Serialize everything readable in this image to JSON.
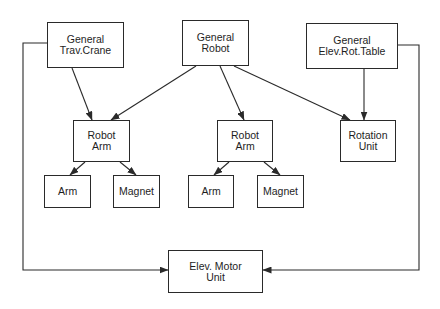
{
  "nodes": {
    "trav_crane": {
      "line1": "General",
      "line2": "Trav.Crane"
    },
    "robot": {
      "line1": "General",
      "line2": "Robot"
    },
    "elev_rot_table": {
      "line1": "General",
      "line2": "Elev.Rot.Table"
    },
    "robot_arm_left": {
      "line1": "Robot",
      "line2": "Arm"
    },
    "robot_arm_right": {
      "line1": "Robot",
      "line2": "Arm"
    },
    "rotation_unit": {
      "line1": "Rotation",
      "line2": "Unit"
    },
    "arm_left": {
      "label": "Arm"
    },
    "magnet_left": {
      "label": "Magnet"
    },
    "arm_right": {
      "label": "Arm"
    },
    "magnet_right": {
      "label": "Magnet"
    },
    "elev_motor_unit": {
      "line1": "Elev. Motor",
      "line2": "Unit"
    }
  },
  "edges": [
    {
      "from": "General Trav.Crane",
      "to": "Robot Arm (left)"
    },
    {
      "from": "General Robot",
      "to": "Robot Arm (left)"
    },
    {
      "from": "General Robot",
      "to": "Robot Arm (right)"
    },
    {
      "from": "General Robot",
      "to": "Rotation Unit"
    },
    {
      "from": "General Elev.Rot.Table",
      "to": "Rotation Unit"
    },
    {
      "from": "Robot Arm (left)",
      "to": "Arm (left)"
    },
    {
      "from": "Robot Arm (left)",
      "to": "Magnet (left)"
    },
    {
      "from": "Robot Arm (right)",
      "to": "Arm (right)"
    },
    {
      "from": "Robot Arm (right)",
      "to": "Magnet (right)"
    },
    {
      "from": "General Trav.Crane",
      "to": "Elev. Motor Unit"
    },
    {
      "from": "General Elev.Rot.Table",
      "to": "Elev. Motor Unit"
    }
  ],
  "colors": {
    "stroke": "#2a2a2a",
    "background": "#ffffff"
  }
}
